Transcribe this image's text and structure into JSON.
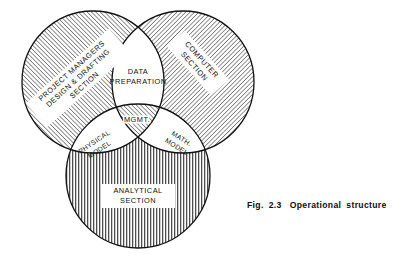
{
  "figure": {
    "caption_prefix": "Fig.",
    "caption_number": "2.3",
    "caption_title_word1": "Operational",
    "caption_title_word2": "structure",
    "caption_full": "Fig. 2.3 Operational structure"
  },
  "diagram": {
    "type": "venn-three-circle",
    "background_color": "#ffffff",
    "stroke_color": "#111111",
    "hatch_color": "#333333",
    "circles": [
      {
        "id": "project-managers",
        "label_line1": "PROJECT MANAGERS",
        "label_line2": "DESIGN & DRAFTING",
        "label_line3": "SECTION",
        "fill": "diagonal-hatch-forward",
        "cx": 93,
        "cy": 82,
        "r": 71,
        "label_rotation": -42
      },
      {
        "id": "computer-section",
        "label_line1": "COMPUTER",
        "label_line2": "SECTION",
        "fill": "diagonal-hatch-back",
        "cx": 183,
        "cy": 82,
        "r": 71,
        "label_rotation": 48
      },
      {
        "id": "analytical-section",
        "label_line1": "ANALYTICAL",
        "label_line2": "SECTION",
        "fill": "vertical-hatch",
        "cx": 138,
        "cy": 176,
        "r": 72,
        "label_rotation": 0
      }
    ],
    "intersections": [
      {
        "id": "data-preparation",
        "label_line1": "DATA",
        "label_line2": "PREPARATION",
        "fill": "white",
        "position": "top-lens",
        "rotation": 0
      },
      {
        "id": "mgmt",
        "label_line1": "MGMT.",
        "label_line2": "",
        "fill": "diagonal-hatch-forward",
        "position": "center-triple",
        "rotation": 0
      },
      {
        "id": "physical-model",
        "label_line1": "PHYSICAL",
        "label_line2": "MODEL",
        "fill": "white",
        "position": "lower-left-lens",
        "rotation": -34
      },
      {
        "id": "math-model",
        "label_line1": "MATH.",
        "label_line2": "MODEL",
        "fill": "white",
        "position": "lower-right-lens",
        "rotation": 32
      }
    ]
  }
}
